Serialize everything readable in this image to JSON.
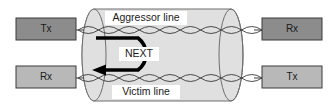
{
  "diagram": {
    "canvas": {
      "width": 336,
      "height": 110,
      "background": "#ffffff"
    },
    "colors": {
      "box_dark": "#8c8c8c",
      "box_light": "#b8b8b8",
      "box_border": "#3a3a3a",
      "cylinder_fill": "#e0e0e0",
      "cylinder_border": "#6e6e6e",
      "wire_stroke": "#3a3a3a",
      "arrow": "#000000",
      "label_bg": "#ffffff",
      "text": "#1a1a1a"
    },
    "cable": {
      "label_top": "Aggressor line",
      "label_bottom": "Victim line"
    },
    "crosstalk": {
      "label": "NEXT",
      "direction": "right-to-left coupling from aggressor to victim"
    },
    "endpoints": [
      {
        "id": "top-left",
        "label": "Tx",
        "shade": "dark",
        "x": 16,
        "y": 18,
        "w": 60,
        "h": 22
      },
      {
        "id": "top-right",
        "label": "Rx",
        "shade": "dark",
        "x": 262,
        "y": 18,
        "w": 60,
        "h": 22
      },
      {
        "id": "bottom-left",
        "label": "Rx",
        "shade": "light",
        "x": 16,
        "y": 66,
        "w": 60,
        "h": 22
      },
      {
        "id": "bottom-right",
        "label": "Tx",
        "shade": "light",
        "x": 262,
        "y": 66,
        "w": 60,
        "h": 22
      }
    ],
    "pairs": [
      {
        "id": "aggressor-pair",
        "y": 30,
        "x_start": 78,
        "x_end": 262,
        "twists": 9
      },
      {
        "id": "victim-pair",
        "y": 78,
        "x_start": 78,
        "x_end": 262,
        "twists": 9
      }
    ]
  }
}
